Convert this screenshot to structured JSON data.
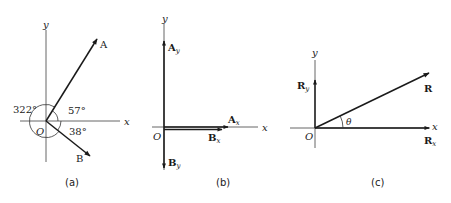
{
  "panels": [
    {
      "id": "a",
      "caption": "(a)",
      "axis_x_label": "x",
      "axis_y_label": "y",
      "origin_label": "O",
      "vectors": [
        {
          "name": "A",
          "label": "A",
          "angle_deg": 57
        },
        {
          "name": "B",
          "label": "B",
          "angle_deg": -38
        }
      ],
      "angle_labels": {
        "a_angle": "57°",
        "b_angle": "38°",
        "b_full_angle": "322°"
      }
    },
    {
      "id": "b",
      "caption": "(b)",
      "axis_x_label": "x",
      "axis_y_label": "y",
      "origin_label": "O",
      "components": [
        {
          "name": "Ay",
          "label_main": "A",
          "label_sub": "y"
        },
        {
          "name": "By",
          "label_main": "B",
          "label_sub": "y"
        },
        {
          "name": "Ax",
          "label_main": "A",
          "label_sub": "x"
        },
        {
          "name": "Bx",
          "label_main": "B",
          "label_sub": "x"
        }
      ]
    },
    {
      "id": "c",
      "caption": "(c)",
      "axis_x_label": "x",
      "axis_y_label": "y",
      "origin_label": "O",
      "resultant_label": "R",
      "angle_label": "θ",
      "components": [
        {
          "name": "Ry",
          "label_main": "R",
          "label_sub": "y"
        },
        {
          "name": "Rx",
          "label_main": "R",
          "label_sub": "x"
        }
      ]
    }
  ],
  "colors": {
    "ink": "#1a1a1a",
    "axis": "#555555"
  }
}
